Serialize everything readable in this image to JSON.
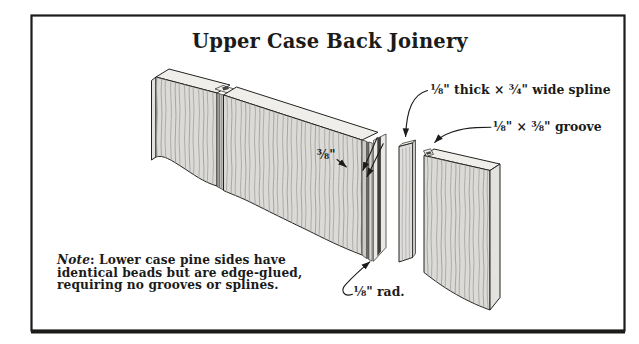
{
  "title": "Upper Case Back Joinery",
  "labels": {
    "spline": "⅛\" thick × ¾\" wide spline",
    "groove": "⅛\" × ⅜\" groove",
    "groove_depth": "⅜\"",
    "bead_radius": "⅛\" rad."
  },
  "note": {
    "label": "Note",
    "line1_rest": ": Lower case pine sides have",
    "line2": "identical beads but are edge-glued,",
    "line3": "requiring no grooves or splines."
  },
  "colors": {
    "ink": "#1b1b1a",
    "wood_face": "#dbdad7",
    "wood_top": "#efeeea",
    "wood_end": "#e3e2df",
    "grain_line": "#a09f9c"
  }
}
